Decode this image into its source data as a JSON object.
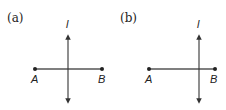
{
  "panels": [
    {
      "label": "(a)",
      "line_label": "l",
      "point_a": "A",
      "point_b": "B",
      "description": "Line l perpendicular to segment AB through its midpoint"
    },
    {
      "label": "(b)",
      "line_label": "l",
      "point_a": "A",
      "point_b": "B",
      "description": "Line l perpendicular to segment AB, not through its midpoint"
    }
  ],
  "colors": {
    "stroke": "#333333",
    "text": "#222222"
  }
}
